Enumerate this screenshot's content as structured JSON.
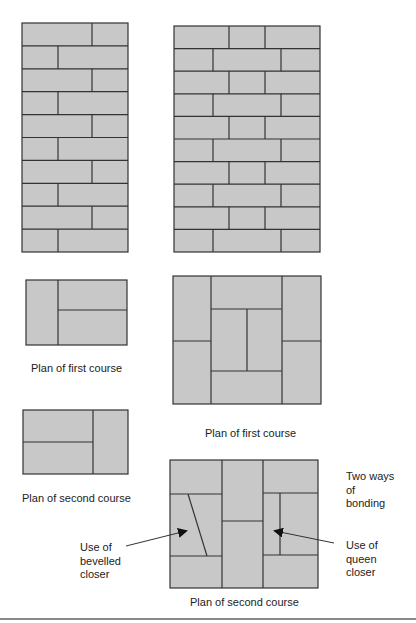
{
  "colors": {
    "brick_fill": "#c8c8c8",
    "mortar_line": "#333333",
    "text": "#222222",
    "rule": "#8a8a8a"
  },
  "figures": {
    "elevation_left": {
      "description": "One-and-a-half brick pier elevation, 10 courses",
      "courses": 10,
      "pattern": "two bricks per course, alternating joint position"
    },
    "elevation_right": {
      "description": "Two brick pier elevation, 10 courses",
      "courses": 10,
      "pattern": "three bricks per course, alternating joint positions"
    },
    "plan_left_first": {
      "caption": "Plan of first course"
    },
    "plan_left_second": {
      "caption": "Plan of second course"
    },
    "plan_right_first": {
      "caption": "Plan of first course"
    },
    "plan_right_second": {
      "caption": "Plan of second course"
    }
  },
  "annotations": {
    "bonding": "Two ways\nof\nbonding",
    "bevelled": "Use of\nbevelled\ncloser",
    "queen": "Use of\nqueen\ncloser"
  },
  "icons": {
    "arrow_left": "arrow-pointer-icon",
    "arrow_right": "arrow-pointer-icon"
  }
}
